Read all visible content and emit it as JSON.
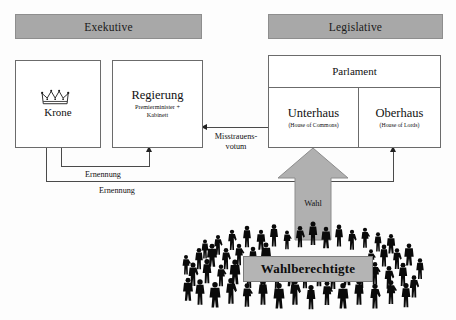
{
  "diagram": {
    "title_visible": false,
    "headers": [
      {
        "key": "executive",
        "label": "Exekutive"
      },
      {
        "key": "legislative",
        "label": "Legislative"
      }
    ],
    "boxes": {
      "krone": {
        "label": "Krone",
        "icon": "crown-icon"
      },
      "regierung": {
        "label": "Regierung",
        "sub_line1": "Premierminister +",
        "sub_line2": "Kabinett"
      },
      "parlament": {
        "label": "Parlament"
      },
      "unterhaus": {
        "label": "Unterhaus",
        "sub": "(House of Commons)"
      },
      "oberhaus": {
        "label": "Oberhaus",
        "sub": "(House of Lords)"
      }
    },
    "arrows": {
      "misstrauensvotum": {
        "line1": "Misstrauens-",
        "line2": "votum"
      },
      "ernennung_regierung": {
        "label": "Ernennung"
      },
      "ernennung_oberhaus": {
        "label": "Ernennung"
      },
      "wahl": {
        "label": "Wahl"
      }
    },
    "crowd": {
      "banner_label": "Wahlberechtigte",
      "silhouette_count": 64
    },
    "colors": {
      "header_fill": "#a8a8a8",
      "banner_fill": "#b4b4b4",
      "arrow_fill": "#b0b0b0",
      "box_stroke": "#6b6b6b",
      "line_stroke": "#4a4a4a",
      "crowd_fill": "#0a0a0a",
      "page_background": "#fdfdfd"
    }
  }
}
